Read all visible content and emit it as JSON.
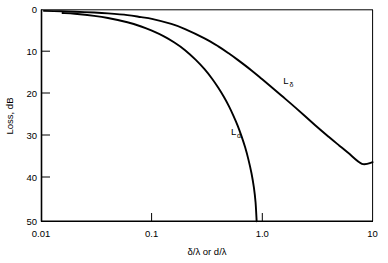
{
  "chart_data": {
    "type": "line",
    "title": "",
    "xlabel": "δ/λ or d/λ",
    "ylabel": "Loss, dB",
    "xscale": "log",
    "yscale": "linear",
    "xlim": [
      0.01,
      10
    ],
    "ylim": [
      0,
      50
    ],
    "y_inverted": true,
    "grid": false,
    "legend": "inline-annotations",
    "xticks": [
      0.01,
      0.1,
      1.0,
      10
    ],
    "xtick_labels": [
      "0.01",
      "0.1",
      "1.0",
      "10"
    ],
    "yticks": [
      0,
      10,
      20,
      30,
      40,
      50
    ],
    "ytick_labels": [
      "0",
      "10",
      "20",
      "30",
      "40",
      "50"
    ],
    "series": [
      {
        "name": "L_delta",
        "label": "L",
        "label_sub": "δ",
        "label_x": 1.55,
        "label_y": 17.5,
        "x": [
          0.0105,
          0.015,
          0.02,
          0.03,
          0.04,
          0.06,
          0.08,
          0.1,
          0.15,
          0.2,
          0.3,
          0.4,
          0.5,
          0.6,
          0.8,
          1.0,
          1.5,
          2.0,
          3.0,
          4.0,
          5.0,
          6.0,
          8.0,
          10.0
        ],
        "y": [
          0.2,
          0.3,
          0.4,
          0.6,
          0.8,
          1.2,
          1.7,
          2.1,
          3.3,
          4.5,
          6.7,
          8.6,
          10.3,
          11.8,
          14.3,
          16.4,
          20.3,
          23.1,
          27.2,
          30.0,
          32.1,
          33.8,
          36.4,
          36.0
        ]
      },
      {
        "name": "L_d",
        "label": "L",
        "label_sub": "d",
        "label_x": 0.52,
        "label_y": 29.5,
        "x": [
          0.0155,
          0.02,
          0.03,
          0.04,
          0.06,
          0.08,
          0.1,
          0.13,
          0.16,
          0.2,
          0.25,
          0.3,
          0.35,
          0.4,
          0.45,
          0.5,
          0.55,
          0.6,
          0.65,
          0.7,
          0.75,
          0.8,
          0.84,
          0.87,
          0.89
        ],
        "y": [
          0.7,
          0.9,
          1.4,
          1.9,
          2.9,
          3.9,
          4.9,
          6.3,
          7.7,
          9.5,
          11.8,
          14.0,
          16.2,
          18.4,
          20.6,
          22.8,
          25.1,
          27.4,
          29.9,
          32.5,
          35.4,
          38.7,
          42.0,
          45.5,
          50.0
        ]
      }
    ]
  },
  "axes": {
    "x_title": "δ/λ or d/λ",
    "y_title": "Loss, dB"
  },
  "colors": {
    "background": "#ffffff",
    "ink": "#000000",
    "curve": "#000000"
  }
}
